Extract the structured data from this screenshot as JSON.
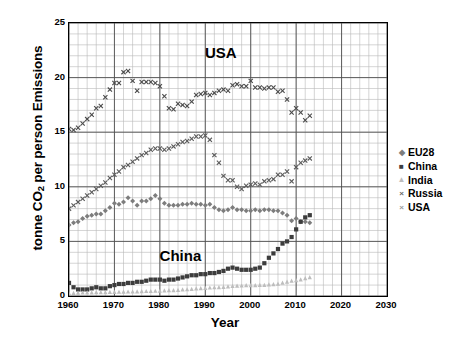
{
  "chart_data": {
    "type": "scatter",
    "title": "",
    "xlabel": "Year",
    "ylabel": "tonne CO2 per person Emissions",
    "ylabel_parts": {
      "pre": "tonne CO",
      "sub": "2",
      "post": " per person Emissions"
    },
    "xlim": [
      1960,
      2030
    ],
    "ylim": [
      0,
      25
    ],
    "xticks": [
      1960,
      1970,
      1980,
      1990,
      2000,
      2010,
      2020,
      2030
    ],
    "yticks": [
      0,
      5,
      10,
      15,
      20,
      25
    ],
    "x_minor_step": 2,
    "y_minor_step": 1,
    "grid": true,
    "legend_position": "right",
    "annotations": [
      {
        "text": "USA",
        "x": 1995,
        "y": 22.2
      },
      {
        "text": "China",
        "x": 1985,
        "y": 3.6
      }
    ],
    "x": [
      1960,
      1961,
      1962,
      1963,
      1964,
      1965,
      1966,
      1967,
      1968,
      1969,
      1970,
      1971,
      1972,
      1973,
      1974,
      1975,
      1976,
      1977,
      1978,
      1979,
      1980,
      1981,
      1982,
      1983,
      1984,
      1985,
      1986,
      1987,
      1988,
      1989,
      1990,
      1991,
      1992,
      1993,
      1994,
      1995,
      1996,
      1997,
      1998,
      1999,
      2000,
      2001,
      2002,
      2003,
      2004,
      2005,
      2006,
      2007,
      2008,
      2009,
      2010,
      2011,
      2012,
      2013
    ],
    "series": [
      {
        "name": "EU28",
        "marker": "diamond",
        "color": "#7d7d7d",
        "values": [
          6.5,
          6.7,
          6.8,
          7.1,
          7.3,
          7.4,
          7.5,
          7.5,
          7.8,
          8.1,
          8.5,
          8.4,
          8.6,
          9.0,
          8.7,
          8.3,
          8.7,
          8.7,
          8.9,
          9.2,
          8.9,
          8.5,
          8.3,
          8.3,
          8.3,
          8.4,
          8.4,
          8.5,
          8.4,
          8.4,
          8.3,
          8.4,
          8.1,
          7.9,
          7.8,
          7.9,
          8.1,
          7.9,
          7.9,
          7.8,
          7.8,
          7.9,
          7.8,
          7.9,
          7.9,
          7.8,
          7.8,
          7.6,
          7.4,
          6.9,
          7.1,
          6.8,
          6.8,
          6.7
        ]
      },
      {
        "name": "China",
        "marker": "square",
        "color": "#3c3c3c",
        "values": [
          1.2,
          0.8,
          0.6,
          0.6,
          0.6,
          0.7,
          0.8,
          0.7,
          0.7,
          0.9,
          1.0,
          1.1,
          1.1,
          1.2,
          1.2,
          1.3,
          1.3,
          1.4,
          1.5,
          1.5,
          1.5,
          1.4,
          1.5,
          1.5,
          1.6,
          1.7,
          1.8,
          1.9,
          1.9,
          2.0,
          2.0,
          2.1,
          2.1,
          2.2,
          2.3,
          2.5,
          2.6,
          2.5,
          2.4,
          2.4,
          2.4,
          2.5,
          2.6,
          3.0,
          3.5,
          3.9,
          4.3,
          4.8,
          5.0,
          5.4,
          6.1,
          6.8,
          7.2,
          7.4
        ]
      },
      {
        "name": "India",
        "marker": "triangle",
        "color": "#bdbdbd",
        "values": [
          0.27,
          0.29,
          0.31,
          0.32,
          0.33,
          0.34,
          0.35,
          0.35,
          0.36,
          0.38,
          0.38,
          0.39,
          0.4,
          0.41,
          0.41,
          0.43,
          0.45,
          0.46,
          0.46,
          0.48,
          0.48,
          0.51,
          0.53,
          0.54,
          0.57,
          0.6,
          0.62,
          0.65,
          0.69,
          0.73,
          0.75,
          0.78,
          0.8,
          0.81,
          0.84,
          0.89,
          0.92,
          0.95,
          0.96,
          1.0,
          0.99,
          1.0,
          1.01,
          1.02,
          1.06,
          1.09,
          1.14,
          1.22,
          1.31,
          1.41,
          1.45,
          1.52,
          1.63,
          1.72
        ]
      },
      {
        "name": "Russia",
        "marker": "cross",
        "color": "#5a5a5a",
        "values": [
          8.0,
          8.3,
          8.6,
          8.9,
          9.2,
          9.5,
          9.8,
          10.1,
          10.4,
          10.8,
          11.1,
          11.4,
          11.8,
          12.0,
          12.3,
          12.6,
          12.9,
          13.1,
          13.4,
          13.5,
          13.5,
          13.4,
          13.5,
          13.7,
          13.9,
          14.1,
          14.2,
          14.4,
          14.6,
          14.6,
          14.7,
          14.3,
          12.9,
          12.2,
          11.0,
          10.6,
          10.6,
          10.0,
          9.8,
          10.1,
          10.2,
          10.3,
          10.2,
          10.5,
          10.6,
          10.7,
          11.1,
          11.1,
          11.4,
          10.5,
          11.8,
          12.2,
          12.4,
          12.6
        ]
      },
      {
        "name": "USA",
        "marker": "cross",
        "color": "#4a4a4a",
        "values": [
          15.3,
          15.2,
          15.4,
          15.8,
          16.2,
          16.6,
          17.2,
          17.4,
          18.2,
          18.9,
          19.5,
          19.5,
          20.5,
          20.6,
          19.7,
          18.8,
          19.6,
          19.6,
          19.6,
          19.5,
          19.2,
          18.3,
          17.2,
          17.1,
          17.6,
          17.5,
          17.4,
          17.8,
          18.4,
          18.5,
          18.6,
          18.4,
          18.6,
          18.8,
          18.9,
          18.8,
          19.3,
          19.4,
          19.2,
          19.2,
          19.7,
          19.1,
          19.1,
          19.0,
          19.1,
          19.1,
          18.7,
          18.8,
          18.0,
          16.8,
          17.2,
          16.8,
          16.1,
          16.5
        ]
      }
    ]
  },
  "legend": {
    "items": [
      {
        "label": "EU28",
        "marker_glyph": "◆",
        "color": "#7d7d7d"
      },
      {
        "label": "China",
        "marker_glyph": "■",
        "color": "#3c3c3c"
      },
      {
        "label": "India",
        "marker_glyph": "▲",
        "color": "#bdbdbd"
      },
      {
        "label": "Russia",
        "marker_glyph": "×",
        "color": "#6a6a6a"
      },
      {
        "label": "USA",
        "marker_glyph": "×",
        "color": "#9a9a9a"
      }
    ]
  }
}
